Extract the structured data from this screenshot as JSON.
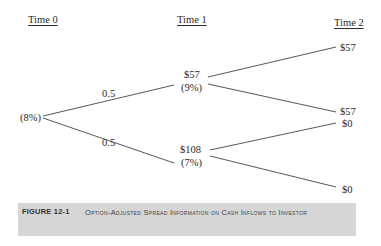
{
  "headers": {
    "time0": "Time 0",
    "time1": "Time 1",
    "time2": "Time 2"
  },
  "nodes": {
    "root": {
      "rate": "(8%)"
    },
    "up": {
      "value": "$57",
      "rate": "(9%)"
    },
    "down": {
      "value": "$108",
      "rate": "(7%)"
    },
    "upup": {
      "value": "$57"
    },
    "updown": {
      "value": "$57"
    },
    "downup": {
      "value": "$0"
    },
    "downdown": {
      "value": "$0"
    }
  },
  "probabilities": {
    "up": "0.5",
    "down": "0.5"
  },
  "caption": {
    "label": "FIGURE 12-1",
    "text": "Option-Adjusted Spread Information on Cash Inflows to Investor"
  },
  "colors": {
    "line": "#444444",
    "caption_bg": "#d6d6d6"
  }
}
